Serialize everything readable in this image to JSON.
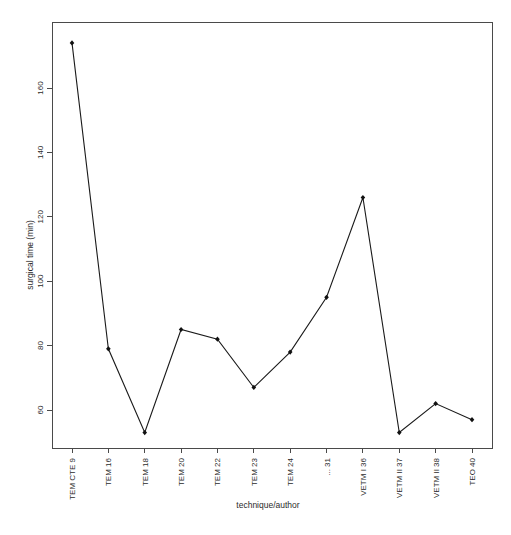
{
  "chart_data": {
    "type": "line",
    "title": "",
    "xlabel": "technique/author",
    "ylabel": "surgical time (min)",
    "categories": [
      "TEM CTE 9",
      "TEM 16",
      "TEM 18",
      "TEM 20",
      "TEM 22",
      "TEM 23",
      "TEM 24",
      "... 31",
      "VETM I 36",
      "VETM II 37",
      "VETM II 38",
      "TEO 40"
    ],
    "values": [
      174,
      79,
      53,
      85,
      82,
      67,
      78,
      95,
      126,
      53,
      62,
      57
    ],
    "ytick_labels": [
      "60",
      "80",
      "100",
      "120",
      "140",
      "160"
    ],
    "yticks": [
      60,
      80,
      100,
      120,
      140,
      160
    ],
    "ylim": [
      48,
      180
    ],
    "xlim": [
      0.5,
      12.5
    ],
    "grid": false,
    "legend": null,
    "marker": "filled-diamond",
    "line_color": "#111111",
    "point_color": "#111111",
    "axis_color": "#4a4a4a",
    "background": "#ffffff"
  },
  "axes": {
    "y_axis_title": "surgical time (min)",
    "x_axis_title": "technique/author"
  }
}
